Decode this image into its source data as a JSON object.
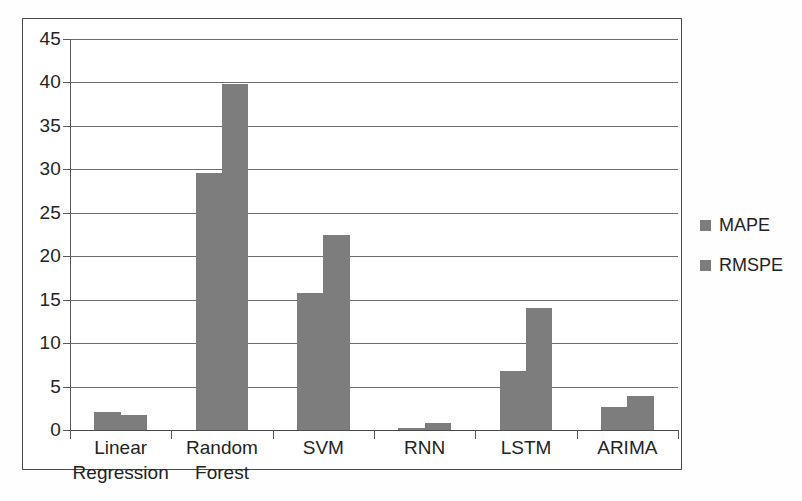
{
  "chart_data": {
    "type": "bar",
    "title": "",
    "subtitle": "",
    "xlabel": "",
    "ylabel": "",
    "ylim": [
      0,
      45
    ],
    "ytick_step": 5,
    "yticks": [
      0,
      5,
      10,
      15,
      20,
      25,
      30,
      35,
      40,
      45
    ],
    "ytick_labels": [
      "0",
      "5",
      "10",
      "15",
      "20",
      "25",
      "30",
      "35",
      "40",
      "45"
    ],
    "grid": true,
    "grid_axis": "y",
    "legend_position": "right",
    "orientation": "vertical",
    "grouping": "grouped",
    "categories": [
      "Linear Regression",
      "Random Forest",
      "SVM",
      "RNN",
      "LSTM",
      "ARIMA"
    ],
    "category_label_lines": [
      [
        "Linear",
        "Regression"
      ],
      [
        "Random",
        "Forest"
      ],
      [
        "SVM"
      ],
      [
        "RNN"
      ],
      [
        "LSTM"
      ],
      [
        "ARIMA"
      ]
    ],
    "series": [
      {
        "name": "MAPE",
        "color": "#7d7d7d",
        "values": [
          2.1,
          29.6,
          15.8,
          0.25,
          6.8,
          2.7
        ]
      },
      {
        "name": "RMSPE",
        "color": "#7d7d7d",
        "values": [
          1.7,
          39.8,
          22.5,
          0.8,
          14.1,
          3.9
        ]
      }
    ],
    "annotations": []
  },
  "legend": {
    "items": [
      {
        "label": "MAPE",
        "color": "#7d7d7d"
      },
      {
        "label": "RMSPE",
        "color": "#7d7d7d"
      }
    ]
  },
  "colors": {
    "bar_fill": "#7d7d7d",
    "gridline": "#6d6d6d",
    "axis": "#5a5a5a",
    "border": "#4a4a4a",
    "text": "#242424",
    "background": "#ffffff"
  }
}
